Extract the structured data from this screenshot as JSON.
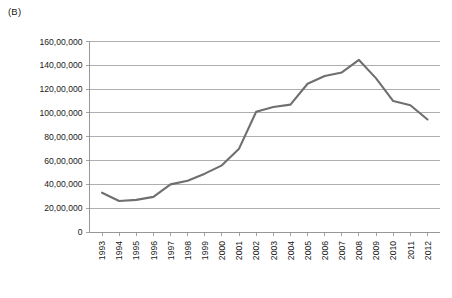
{
  "figure": {
    "panel_label": "(B)"
  },
  "chart_data": {
    "type": "line",
    "title": "",
    "subtitle": "",
    "xlabel": "",
    "ylabel": "",
    "categories": [
      "1993",
      "1994",
      "1995",
      "1996",
      "1997",
      "1998",
      "1999",
      "2000",
      "2001",
      "2002",
      "2003",
      "2004",
      "2005",
      "2006",
      "2007",
      "2008",
      "2009",
      "2010",
      "2011",
      "2012"
    ],
    "series": [
      {
        "name": "Series 1",
        "color": "#6f6f6f",
        "values": [
          3300000,
          2600000,
          2700000,
          2950000,
          4000000,
          4300000,
          4900000,
          5600000,
          7000000,
          10100000,
          10500000,
          10700000,
          12450000,
          13100000,
          13400000,
          14450000,
          12900000,
          11000000,
          10650000,
          9450000
        ]
      }
    ],
    "ylim": [
      0,
      16000000
    ],
    "ytick_values": [
      0,
      2000000,
      4000000,
      6000000,
      8000000,
      10000000,
      12000000,
      14000000,
      16000000
    ],
    "ytick_labels": [
      "0",
      "20,00,000",
      "40,00,000",
      "60,00,000",
      "80,00,000",
      "100,00,000",
      "120,00,000",
      "140,00,000",
      "160,00,000"
    ],
    "grid": true,
    "grid_axis": "y",
    "legend": false,
    "legend_position": "none",
    "xtick_rotation": -90,
    "line_color": "#6f6f6f",
    "gridline_color": "#9a9a9a",
    "axis_color": "#8c8c8c",
    "background_color": "#ffffff"
  }
}
